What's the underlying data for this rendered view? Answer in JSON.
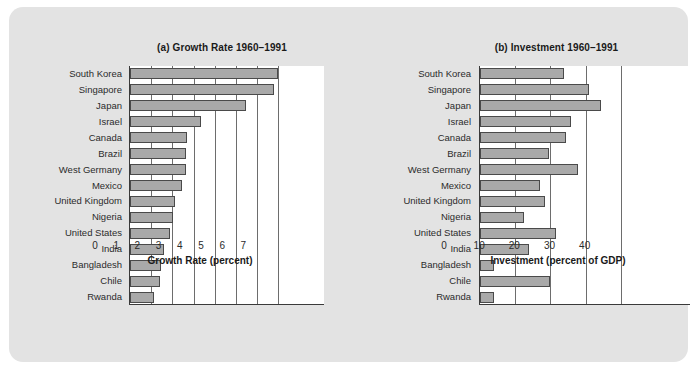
{
  "figure": {
    "background_color": "#e3e3e3",
    "bar_fill_color": "#a9a9a9",
    "bar_border_color": "#4a4a4a",
    "plot_background_color": "#ffffff"
  },
  "chart_data": [
    {
      "id": "growth-rate",
      "type": "bar",
      "orientation": "horizontal",
      "title": "(a) Growth Rate 1960–1991",
      "xlabel": "Growth Rate (percent)",
      "ylabel": "",
      "xlim": [
        0,
        9.2
      ],
      "xticks": [
        0,
        1,
        2,
        3,
        4,
        5,
        6,
        7
      ],
      "xticklabels": [
        "0",
        "1",
        "2",
        "3",
        "4",
        "5",
        "6",
        "7"
      ],
      "grid": "vertical",
      "legend": "none",
      "categories": [
        "South Korea",
        "Singapore",
        "Japan",
        "Israel",
        "Canada",
        "Brazil",
        "West Germany",
        "Mexico",
        "United Kingdom",
        "Nigeria",
        "United States",
        "India",
        "Bangladesh",
        "Chile",
        "Rwanda"
      ],
      "values": [
        7.0,
        6.8,
        5.45,
        3.35,
        2.7,
        2.65,
        2.65,
        2.45,
        2.1,
        2.05,
        1.9,
        1.6,
        1.45,
        1.4,
        1.15
      ]
    },
    {
      "id": "investment",
      "type": "bar",
      "orientation": "horizontal",
      "title": "(b) Investment 1960–1991",
      "xlabel": "Investment (percent of GDP)",
      "ylabel": "",
      "xlim": [
        0,
        60
      ],
      "xticks": [
        0,
        10,
        20,
        30,
        40
      ],
      "xticklabels": [
        "0",
        "10",
        "20",
        "30",
        "40"
      ],
      "grid": "vertical",
      "legend": "none",
      "categories": [
        "South Korea",
        "Singapore",
        "Japan",
        "Israel",
        "Canada",
        "Brazil",
        "West Germany",
        "Mexico",
        "United Kingdom",
        "Nigeria",
        "United States",
        "India",
        "Bangladesh",
        "Chile",
        "Rwanda"
      ],
      "values": [
        24.0,
        31.0,
        34.5,
        26.0,
        24.5,
        19.5,
        28.0,
        17.0,
        18.5,
        12.5,
        21.5,
        14.0,
        4.0,
        20.0,
        4.0
      ]
    }
  ]
}
